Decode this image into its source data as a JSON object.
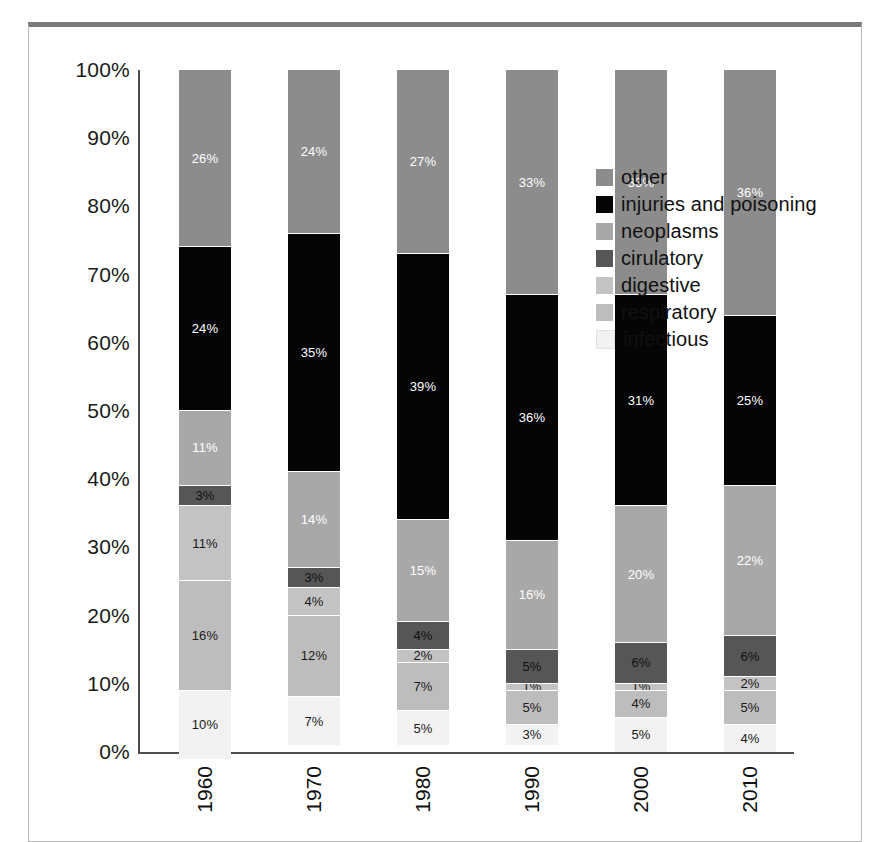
{
  "chart_data": {
    "type": "bar",
    "subtype": "stacked-100-percent",
    "title": "",
    "xlabel": "",
    "ylabel": "",
    "ylim": [
      0,
      100
    ],
    "grid": false,
    "legend_position": "right",
    "categories": [
      "1960",
      "1970",
      "1980",
      "1990",
      "2000",
      "2010"
    ],
    "y_ticks": [
      "0%",
      "10%",
      "20%",
      "30%",
      "40%",
      "50%",
      "60%",
      "70%",
      "80%",
      "90%",
      "100%"
    ],
    "y_tick_values": [
      0,
      10,
      20,
      30,
      40,
      50,
      60,
      70,
      80,
      90,
      100
    ],
    "stack_order_bottom_to_top": [
      "infectious",
      "respiratory",
      "digestive",
      "cirulatory",
      "neoplasms",
      "injuries and poisoning",
      "other"
    ],
    "series": [
      {
        "name": "other",
        "color": "#8c8c8c",
        "label_color": "#ffffff",
        "values": [
          26,
          24,
          27,
          33,
          33,
          36
        ],
        "labels": [
          "26%",
          "24%",
          "27%",
          "33%",
          "33%",
          "36%"
        ]
      },
      {
        "name": "injuries and poisoning",
        "color": "#050505",
        "label_color": "#ffffff",
        "values": [
          24,
          35,
          39,
          36,
          31,
          25
        ],
        "labels": [
          "24%",
          "35%",
          "39%",
          "36%",
          "31%",
          "25%"
        ]
      },
      {
        "name": "neoplasms",
        "color": "#a8a8a8",
        "label_color": "#ffffff",
        "values": [
          11,
          14,
          15,
          16,
          20,
          22
        ],
        "labels": [
          "11%",
          "14%",
          "15%",
          "16%",
          "20%",
          "22%"
        ]
      },
      {
        "name": "cirulatory",
        "color": "#565656",
        "label_color": "#111111",
        "values": [
          3,
          3,
          4,
          5,
          6,
          6
        ],
        "labels": [
          "3%",
          "3%",
          "4%",
          "5%",
          "6%",
          "6%"
        ]
      },
      {
        "name": "digestive",
        "color": "#c3c3c3",
        "label_color": "#1a1a1a",
        "values": [
          11,
          4,
          2,
          1,
          1,
          2
        ],
        "labels": [
          "11%",
          "4%",
          "2%",
          "1%",
          "1%",
          "2%"
        ]
      },
      {
        "name": "respiratory",
        "color": "#bdbdbd",
        "label_color": "#1a1a1a",
        "values": [
          16,
          12,
          7,
          5,
          4,
          5
        ],
        "labels": [
          "16%",
          "12%",
          "7%",
          "5%",
          "4%",
          "5%"
        ]
      },
      {
        "name": "infectious",
        "color": "#f2f2f2",
        "label_color": "#1a1a1a",
        "values": [
          10,
          7,
          5,
          3,
          5,
          4
        ],
        "labels": [
          "10%",
          "7%",
          "5%",
          "3%",
          "5%",
          "4%"
        ]
      }
    ]
  },
  "legend": {
    "items": [
      {
        "label": "other",
        "color": "#8c8c8c"
      },
      {
        "label": "injuries and poisoning",
        "color": "#050505"
      },
      {
        "label": "neoplasms",
        "color": "#a8a8a8"
      },
      {
        "label": "cirulatory",
        "color": "#565656"
      },
      {
        "label": "digestive",
        "color": "#c3c3c3"
      },
      {
        "label": "respiratory",
        "color": "#bdbdbd"
      },
      {
        "label": "infectious",
        "color": "#f2f2f2"
      }
    ]
  },
  "colors": {
    "axis": "#4d4d4d",
    "frame_border": "#b9b9b9",
    "frame_top_bar": "#7a7a7a",
    "page_background": "#ffffff",
    "text": "#111111"
  }
}
